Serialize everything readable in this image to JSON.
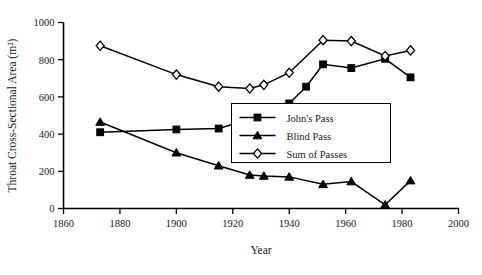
{
  "chart_data": {
    "type": "line",
    "title": "",
    "xlabel": "Year",
    "ylabel": "Throat Cross-Sectional Area (m²)",
    "xlim": [
      1860,
      2000
    ],
    "ylim": [
      0,
      1000
    ],
    "xticks": [
      1860,
      1880,
      1900,
      1920,
      1940,
      1960,
      1980,
      2000
    ],
    "yticks": [
      0,
      200,
      400,
      600,
      800,
      1000
    ],
    "grid": false,
    "legend_position": "center-right",
    "series": [
      {
        "name": "John's Pass",
        "marker": "filled-square",
        "x": [
          1873,
          1900,
          1915,
          1926,
          1931,
          1940,
          1946,
          1952,
          1962,
          1974,
          1983
        ],
        "y": [
          410,
          425,
          430,
          480,
          510,
          565,
          655,
          775,
          755,
          805,
          705
        ]
      },
      {
        "name": "Blind Pass",
        "marker": "filled-triangle",
        "x": [
          1873,
          1900,
          1915,
          1926,
          1931,
          1940,
          1952,
          1962,
          1974,
          1983
        ],
        "y": [
          465,
          300,
          230,
          180,
          175,
          170,
          130,
          145,
          20,
          150
        ]
      },
      {
        "name": "Sum of Passes",
        "marker": "open-diamond",
        "x": [
          1873,
          1900,
          1915,
          1926,
          1931,
          1940,
          1952,
          1962,
          1974,
          1983
        ],
        "y": [
          875,
          720,
          655,
          645,
          665,
          730,
          905,
          900,
          820,
          850
        ]
      }
    ]
  },
  "legend": {
    "items": [
      {
        "label": "John's Pass",
        "marker": "filled-square"
      },
      {
        "label": "Blind Pass",
        "marker": "filled-triangle"
      },
      {
        "label": "Sum of Passes",
        "marker": "open-diamond"
      }
    ]
  },
  "axes": {
    "x_label": "Year",
    "y_label": "Throat Cross-Sectional Area (m²)",
    "x_tick_labels": [
      "1860",
      "1880",
      "1900",
      "1920",
      "1940",
      "1960",
      "1980",
      "2000"
    ],
    "y_tick_labels": [
      "0",
      "200",
      "400",
      "600",
      "800",
      "1000"
    ]
  },
  "colors": {
    "axis": "#000000",
    "marker_fill": "#000000",
    "diamond_fill": "#ffffff",
    "background": "#ffffff"
  }
}
